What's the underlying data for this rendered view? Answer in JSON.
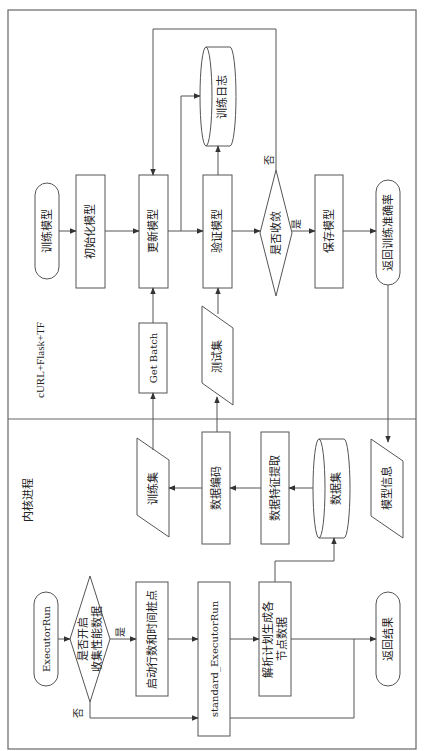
{
  "lanes": {
    "top": "cURL+Flask+TF",
    "bottom": "内核进程"
  },
  "top_flow": {
    "start": "训练模型",
    "init": "初始化模型",
    "update": "更新模型",
    "validate": "验证模型",
    "converge": "是否收敛",
    "save": "保存模型",
    "return_acc": "返回训练准确率",
    "train_log": "训练日志",
    "get_batch": "Get Batch",
    "test_set": "测试集",
    "yes": "是",
    "no": "否"
  },
  "data_flow": {
    "train_set": "训练集",
    "encode": "数据编码",
    "feature": "数据特征提取",
    "dataset": "数据集",
    "model_info": "模型信息"
  },
  "bottom_flow": {
    "start": "ExecutorRun",
    "decision_line1": "是否开启",
    "decision_line2": "收集性能数据",
    "stub": "启动行数和时间桩点",
    "standard": "standard_ExecutorRun",
    "parse_line1": "解析计划生成各",
    "parse_line2": "节点数据",
    "end": "返回结果",
    "yes": "是",
    "no": "否"
  },
  "colors": {
    "stroke": "#555555",
    "text": "#222222",
    "background": "#ffffff"
  }
}
